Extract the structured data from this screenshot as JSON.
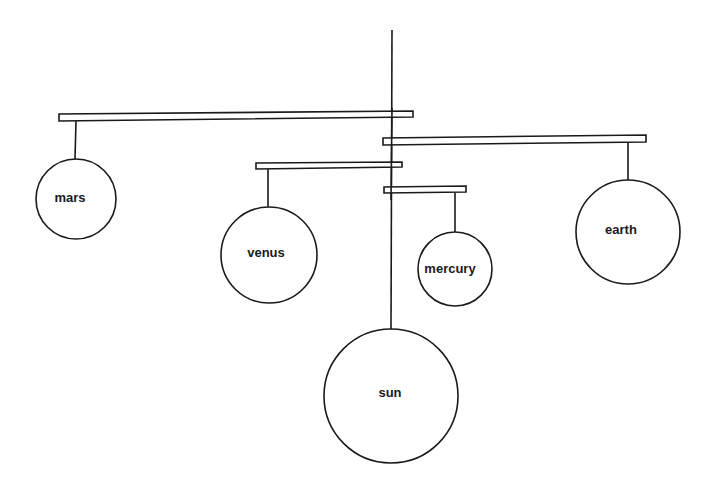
{
  "diagram": {
    "type": "solar-system-mobile",
    "stroke_color": "#1a1a1a",
    "background": "#ffffff",
    "bodies": [
      {
        "id": "mars",
        "label": "mars",
        "cx": 76,
        "cy": 199,
        "r": 40
      },
      {
        "id": "venus",
        "label": "venus",
        "cx": 269,
        "cy": 255,
        "r": 48
      },
      {
        "id": "mercury",
        "label": "mercury",
        "cx": 455,
        "cy": 269,
        "r": 37
      },
      {
        "id": "earth",
        "label": "earth",
        "cx": 628,
        "cy": 232,
        "r": 52
      },
      {
        "id": "sun",
        "label": "sun",
        "cx": 391,
        "cy": 396,
        "r": 67
      }
    ]
  }
}
